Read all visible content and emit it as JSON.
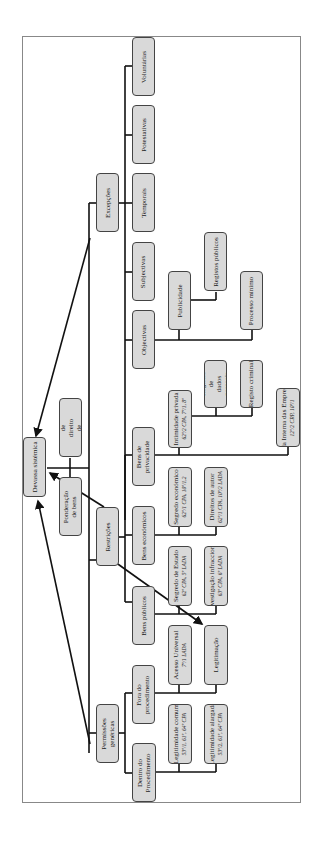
{
  "diagram": {
    "root": "Devassa sistémica",
    "nodes": {
      "excepcoes": "Excepções",
      "voluntarias": "Voluntárias",
      "potestativas": "Potestativas",
      "temporais": "Temporais",
      "subjectivas": "Subjectivas",
      "objectivas": "Objectivas",
      "publicidade": "Publicidade",
      "registos_publicos": "Registos públicos",
      "processo_minimo": "Processo mínimo",
      "abuso": "Abuso de direito de acesso",
      "ponderacao": "Ponderação de bens",
      "restricoes": "Restrições",
      "bens_privacidade": "Bens de privacidade",
      "intimidade": "Intimidade privada",
      "intimidade_ref": "62º/2 CPA, 7º/1, 8º",
      "registos_dados": "Registos de dados pessoais",
      "registo_criminal": "Registo criminal",
      "vida_interna": "Vida Interna das Empresas",
      "vida_interna_ref": "12º/2 CRP, 10º/1",
      "bens_economicos": "Bens económicos",
      "segredo_economico": "Segredo económico",
      "segredo_economico_ref": "62º/1 CPA, 10º/1,2",
      "direitos_autor": "Direitos de autor",
      "direitos_autor_ref": "62º/1 CPA, 10º/2 LADA",
      "bens_publicos": "Bens públicos",
      "segredo_estado": "Segredo de Estado",
      "segredo_estado_ref": "62º CPA, 5º LADA",
      "investigacao": "Investigação infraccional",
      "investigacao_ref": "63º CPA, 6º LADA",
      "legitimacao": "Legitimação",
      "permissoes": "Permissões genéricas",
      "fora": "Fora do procedimento",
      "acesso_universal": "Acesso Universal",
      "acesso_universal_ref": "7º/1 LADA",
      "dentro": "Dentro do Procedimento",
      "legit_comum": "Legitimidade comum",
      "legit_comum_ref": "53º/1, 61º, 64º CPA",
      "legit_alargada": "Legitimidade alargada",
      "legit_alargada_ref": "53º/2, 61º, 64º CPA"
    }
  }
}
